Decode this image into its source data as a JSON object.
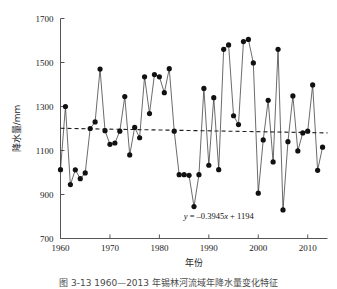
{
  "figure": {
    "caption": "图 3-13    1960—2013 年锡林河流域年降水量变化特征",
    "background": "#ffffff",
    "line_color": "#2b2b2b",
    "marker_color": "#111111",
    "trend_color": "#1f1f1f",
    "axis_color": "#555555"
  },
  "chart_data": {
    "type": "line",
    "title": "",
    "subtitle": "",
    "xlabel": "年份",
    "ylabel": "降水量/mm",
    "xlim": [
      1960,
      2014
    ],
    "ylim": [
      700,
      1700
    ],
    "xticks": [
      1960,
      1970,
      1980,
      1990,
      2000,
      2010
    ],
    "xtick_labels": [
      "1960",
      "1970",
      "1980",
      "1990",
      "2000",
      "2010"
    ],
    "yticks": [
      700,
      900,
      1100,
      1300,
      1500,
      1700
    ],
    "ytick_labels": [
      "700",
      "900",
      "1100",
      "1300",
      "1500",
      "1700"
    ],
    "grid": false,
    "legend": null,
    "annotations": [
      {
        "name": "trend-equation",
        "text": "y = –0.3945x + 1194",
        "text_prefix": "y",
        "text_body": " = –0.3945",
        "text_var": "x",
        "text_suffix": " + 1194",
        "x": 1992,
        "y": 790
      }
    ],
    "marker": "filled-circle",
    "marker_size": 2.6,
    "x": [
      1960,
      1961,
      1962,
      1963,
      1964,
      1965,
      1966,
      1967,
      1968,
      1969,
      1970,
      1971,
      1972,
      1973,
      1974,
      1975,
      1976,
      1977,
      1978,
      1979,
      1980,
      1981,
      1982,
      1983,
      1984,
      1985,
      1986,
      1987,
      1988,
      1989,
      1990,
      1991,
      1992,
      1993,
      1994,
      1995,
      1996,
      1997,
      1998,
      1999,
      2000,
      2001,
      2002,
      2003,
      2004,
      2005,
      2006,
      2007,
      2008,
      2009,
      2010,
      2011,
      2012,
      2013
    ],
    "values": [
      1013,
      1300,
      945,
      1012,
      972,
      998,
      1200,
      1230,
      1470,
      1190,
      1128,
      1134,
      1188,
      1345,
      1080,
      1205,
      1158,
      1435,
      1268,
      1445,
      1435,
      1363,
      1472,
      1188,
      990,
      990,
      987,
      845,
      990,
      1382,
      1033,
      1340,
      1013,
      1560,
      1580,
      1258,
      1218,
      1595,
      1605,
      1498,
      906,
      1148,
      1328,
      1048,
      1560,
      830,
      1140,
      1348,
      1098,
      1180,
      1188,
      1398,
      1010,
      1115
    ],
    "trend": {
      "equation": "y = -0.3945x + 1194",
      "slope_per_year": -0.3945,
      "intercept": 1194,
      "start": {
        "x": 1960,
        "y": 1201
      },
      "end": {
        "x": 2014,
        "y": 1180
      },
      "style": "dashed"
    }
  }
}
